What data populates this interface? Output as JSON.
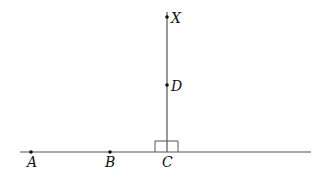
{
  "diagram": {
    "type": "geometry",
    "points": [
      {
        "name": "A",
        "label": "A",
        "x": 31,
        "y": 152
      },
      {
        "name": "B",
        "label": "B",
        "x": 110,
        "y": 152
      },
      {
        "name": "C",
        "label": "C",
        "x": 167,
        "y": 152
      },
      {
        "name": "D",
        "label": "D",
        "x": 167,
        "y": 85
      },
      {
        "name": "X",
        "label": "X",
        "x": 167,
        "y": 17
      }
    ],
    "lines": [
      {
        "name": "horizontal-line",
        "from": [
          20,
          152
        ],
        "to": [
          311,
          152
        ]
      },
      {
        "name": "perpendicular-line",
        "from": [
          167,
          152
        ],
        "to": [
          167,
          12
        ]
      }
    ],
    "right_angle_mark": {
      "at": "C",
      "x1": 155,
      "x2": 178,
      "top": 141
    },
    "colors": {
      "line": "#555555",
      "point": "#111111",
      "label": "#111111"
    }
  }
}
